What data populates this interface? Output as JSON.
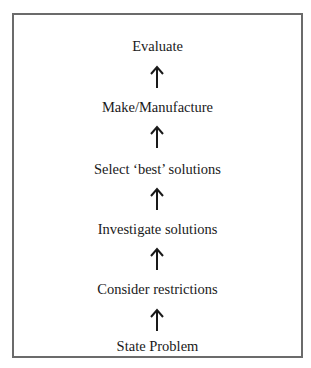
{
  "diagram": {
    "type": "flow-up",
    "steps": [
      {
        "label": "Evaluate"
      },
      {
        "label": "Make/Manufacture"
      },
      {
        "label": "Select ‘best’ solutions"
      },
      {
        "label": "Investigate solutions"
      },
      {
        "label": "Consider restrictions"
      },
      {
        "label": "State Problem"
      }
    ],
    "arrow_direction": "up",
    "colors": {
      "border": "#6b6b6b",
      "text": "#1a1a1a",
      "background": "#ffffff"
    }
  }
}
